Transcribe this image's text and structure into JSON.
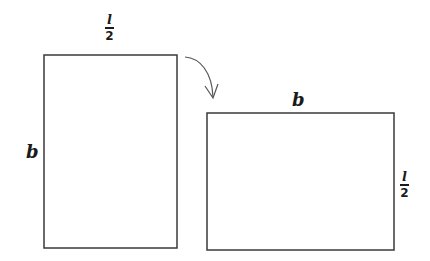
{
  "diagram": {
    "left_rect": {
      "top_label": {
        "numerator": "l",
        "denominator": "2"
      },
      "side_label": "b"
    },
    "right_rect": {
      "top_label": "b",
      "side_label": {
        "numerator": "l",
        "denominator": "2"
      }
    },
    "arrow": "curved-arrow-rotate",
    "stroke_color": "#3a3a3a"
  }
}
